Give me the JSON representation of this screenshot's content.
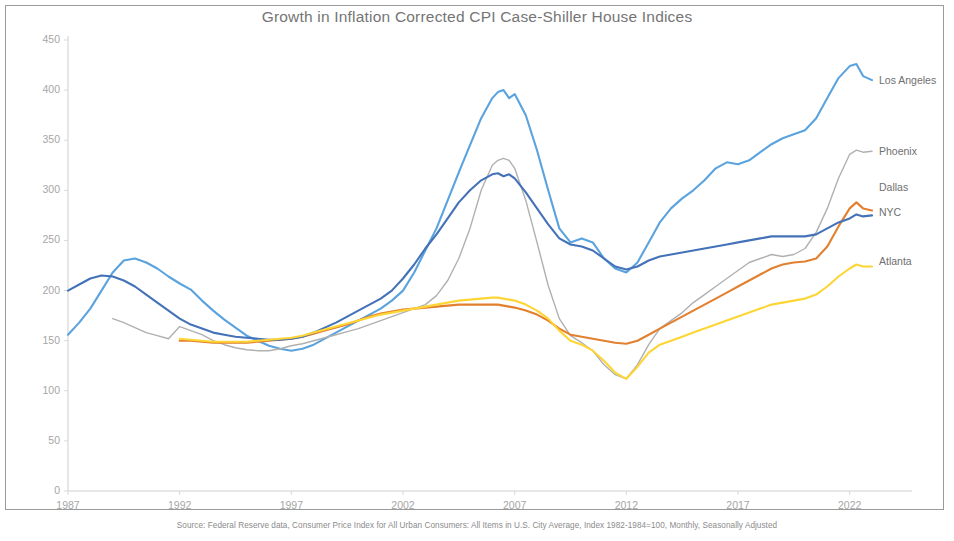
{
  "title": "Growth in Inflation Corrected CPI Case-Shiller House Indices",
  "source": "Source: Federal Reserve data, Consumer Price Index for All Urban Consumers: All Items in U.S. City Average,  Index 1982-1984=100, Monthly, Seasonally Adjusted",
  "chart_data": {
    "type": "line",
    "title": "Growth in Inflation Corrected CPI Case-Shiller House Indices",
    "xlabel": "",
    "ylabel": "",
    "xlim": [
      1987,
      2023.5
    ],
    "ylim": [
      0,
      460
    ],
    "yticks": [
      0,
      50,
      100,
      150,
      200,
      250,
      300,
      350,
      400,
      450
    ],
    "xticks": [
      1987,
      1992,
      1997,
      2002,
      2007,
      2012,
      2017,
      2022
    ],
    "grid": false,
    "legend_position": "right-inline-labels",
    "x": [
      1987,
      1987.5,
      1988,
      1988.5,
      1989,
      1989.5,
      1990,
      1990.5,
      1991,
      1991.5,
      1992,
      1992.5,
      1993,
      1993.5,
      1994,
      1994.5,
      1995,
      1995.5,
      1996,
      1996.5,
      1997,
      1997.5,
      1998,
      1998.5,
      1999,
      1999.5,
      2000,
      2000.5,
      2001,
      2001.5,
      2002,
      2002.5,
      2003,
      2003.5,
      2004,
      2004.5,
      2005,
      2005.5,
      2006,
      2006.25,
      2006.5,
      2006.75,
      2007,
      2007.5,
      2008,
      2008.5,
      2009,
      2009.5,
      2010,
      2010.5,
      2011,
      2011.5,
      2012,
      2012.5,
      2013,
      2013.5,
      2014,
      2014.5,
      2015,
      2015.5,
      2016,
      2016.5,
      2017,
      2017.5,
      2018,
      2018.5,
      2019,
      2019.5,
      2020,
      2020.5,
      2021,
      2021.5,
      2022,
      2022.3,
      2022.6,
      2023
    ],
    "series": [
      {
        "name": "Los Angeles",
        "color": "#5BA3DE",
        "label_y": 81,
        "values": [
          156,
          168,
          182,
          200,
          218,
          230,
          232,
          228,
          222,
          214,
          207,
          201,
          190,
          180,
          171,
          163,
          155,
          150,
          145,
          142,
          140,
          142,
          146,
          152,
          158,
          164,
          170,
          176,
          182,
          190,
          200,
          218,
          240,
          262,
          290,
          318,
          345,
          372,
          392,
          398,
          400,
          392,
          396,
          375,
          340,
          300,
          262,
          248,
          252,
          248,
          232,
          222,
          218,
          228,
          248,
          268,
          282,
          292,
          300,
          310,
          322,
          328,
          326,
          330,
          338,
          346,
          352,
          356,
          360,
          372,
          392,
          412,
          424,
          426,
          414,
          410
        ]
      },
      {
        "name": "Phoenix",
        "color": "#B0B0B0",
        "label_y": 152,
        "values": [
          null,
          null,
          null,
          null,
          172,
          168,
          163,
          158,
          155,
          152,
          164,
          160,
          156,
          150,
          146,
          143,
          141,
          140,
          140,
          142,
          145,
          147,
          150,
          153,
          156,
          159,
          162,
          166,
          170,
          174,
          178,
          182,
          186,
          195,
          210,
          232,
          262,
          300,
          325,
          330,
          332,
          330,
          322,
          290,
          248,
          205,
          172,
          155,
          148,
          140,
          126,
          116,
          112,
          126,
          146,
          162,
          170,
          178,
          188,
          196,
          204,
          212,
          220,
          228,
          232,
          236,
          234,
          236,
          242,
          258,
          282,
          312,
          336,
          340,
          338,
          339
        ]
      },
      {
        "name": "Dallas",
        "color": "#E2802F",
        "label_y": 188,
        "values": [
          null,
          null,
          null,
          null,
          null,
          null,
          null,
          null,
          null,
          null,
          150,
          150,
          149,
          148,
          148,
          148,
          148,
          149,
          150,
          151,
          152,
          154,
          157,
          160,
          163,
          166,
          170,
          174,
          177,
          179,
          181,
          182,
          183,
          184,
          185,
          186,
          186,
          186,
          186,
          186,
          185,
          184,
          183,
          180,
          176,
          170,
          162,
          156,
          154,
          152,
          150,
          148,
          147,
          150,
          156,
          162,
          168,
          174,
          180,
          186,
          192,
          198,
          204,
          210,
          216,
          222,
          226,
          228,
          229,
          232,
          244,
          264,
          282,
          288,
          282,
          280
        ]
      },
      {
        "name": "NYC",
        "color": "#4472B8",
        "label_y": 213,
        "values": [
          200,
          206,
          212,
          215,
          214,
          210,
          204,
          196,
          188,
          180,
          172,
          166,
          162,
          158,
          156,
          154,
          153,
          152,
          151,
          151,
          152,
          154,
          158,
          163,
          168,
          174,
          180,
          186,
          192,
          200,
          212,
          226,
          242,
          256,
          272,
          288,
          300,
          310,
          316,
          317,
          314,
          316,
          312,
          298,
          282,
          266,
          252,
          246,
          244,
          240,
          232,
          224,
          221,
          224,
          230,
          234,
          236,
          238,
          240,
          242,
          244,
          246,
          248,
          250,
          252,
          254,
          254,
          254,
          254,
          256,
          262,
          268,
          272,
          276,
          274,
          275
        ]
      },
      {
        "name": "Atlanta",
        "color": "#FDD535",
        "label_y": 262,
        "values": [
          null,
          null,
          null,
          null,
          null,
          null,
          null,
          null,
          null,
          null,
          152,
          151,
          150,
          149,
          149,
          149,
          149,
          150,
          151,
          152,
          153,
          155,
          158,
          161,
          164,
          167,
          170,
          173,
          176,
          178,
          180,
          182,
          184,
          186,
          188,
          190,
          191,
          192,
          193,
          193,
          192,
          191,
          190,
          186,
          180,
          172,
          160,
          150,
          146,
          140,
          130,
          118,
          112,
          124,
          138,
          146,
          150,
          154,
          158,
          162,
          166,
          170,
          174,
          178,
          182,
          186,
          188,
          190,
          192,
          196,
          204,
          214,
          222,
          226,
          224,
          224
        ]
      }
    ]
  },
  "axis": {
    "y_labels": [
      "450",
      "400",
      "350",
      "300",
      "250",
      "200",
      "150",
      "100",
      "50",
      "0"
    ],
    "x_labels": [
      "1987",
      "1992",
      "1997",
      "2002",
      "2007",
      "2012",
      "2017",
      "2022"
    ]
  }
}
